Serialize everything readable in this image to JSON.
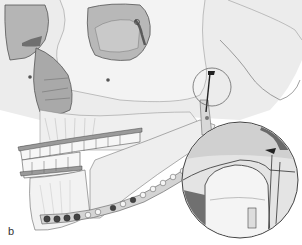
{
  "figure": {
    "panel_label": "b",
    "colors": {
      "bone_light": "#ececec",
      "bone_mid": "#d9d9d9",
      "bone_shadow": "#b5b5b5",
      "orbit_dark": "#8a8a8a",
      "line": "#555555",
      "plate": "#c8c8c8",
      "screw_dark": "#444444",
      "background": "#ffffff"
    },
    "plate_screws_lower": 6,
    "plate_holes_ramus": 8,
    "inset": {
      "description": "magnified view of condyle region with fixation"
    }
  }
}
